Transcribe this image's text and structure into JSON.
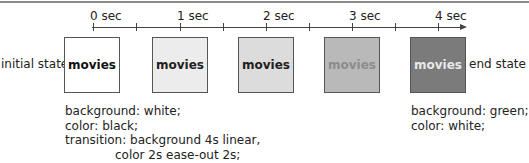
{
  "timeline": {
    "ticks": [
      {
        "label": "0 sec",
        "x": 93
      },
      {
        "label": "",
        "x": 136
      },
      {
        "label": "1 sec",
        "x": 180
      },
      {
        "label": "",
        "x": 223
      },
      {
        "label": "2 sec",
        "x": 266
      },
      {
        "label": "",
        "x": 309
      },
      {
        "label": "3 sec",
        "x": 352
      },
      {
        "label": "",
        "x": 395
      },
      {
        "label": "4 sec",
        "x": 438
      }
    ]
  },
  "labels": {
    "initial_state": "initial state",
    "end_state": "end state"
  },
  "boxes": [
    {
      "text": "movies",
      "bg": "#ffffff",
      "color": "#111111",
      "x": 64
    },
    {
      "text": "movies",
      "bg": "#ececec",
      "color": "#222222",
      "x": 152
    },
    {
      "text": "movies",
      "bg": "#dcdcdc",
      "color": "#222222",
      "x": 238
    },
    {
      "text": "movies",
      "bg": "#b9b9b9",
      "color": "#8c8c8c",
      "x": 324
    },
    {
      "text": "movies",
      "bg": "#7b7b7b",
      "color": "#e8e8e8",
      "x": 410
    }
  ],
  "initial_css": {
    "line1": "background: white;",
    "line2": "color: black;",
    "line3": "transition: background 4s linear,",
    "line4": "color 2s ease-out 2s;"
  },
  "end_css": {
    "line1": "background: green;",
    "line2": "color: white;"
  }
}
